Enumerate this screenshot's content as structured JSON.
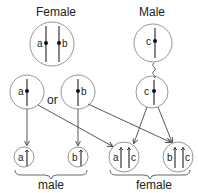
{
  "diagram": {
    "parents": {
      "female": {
        "label": "Female",
        "alleles": [
          "a",
          "b"
        ]
      },
      "male": {
        "label": "Male",
        "alleles": [
          "c"
        ]
      }
    },
    "gametes": {
      "female_options": [
        "a",
        "b"
      ],
      "connector": "or",
      "male": "c"
    },
    "offspring": {
      "male": {
        "label": "male",
        "genotypes": [
          "a",
          "b"
        ]
      },
      "female": {
        "label": "female",
        "genotypes": [
          [
            "a",
            "c"
          ],
          [
            "b",
            "c"
          ]
        ]
      }
    }
  }
}
